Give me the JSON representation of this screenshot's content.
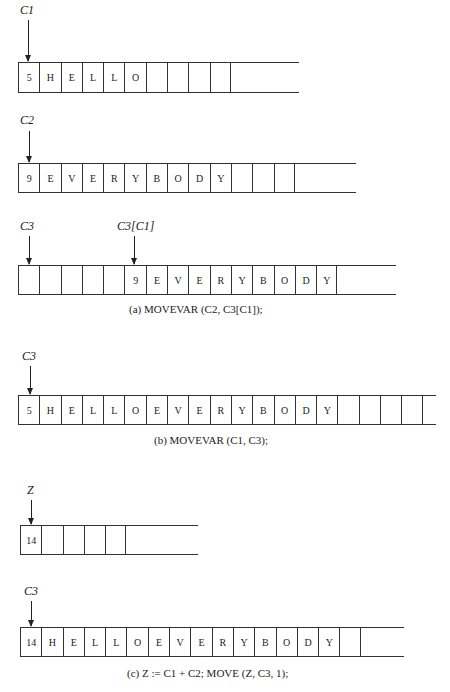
{
  "figure": {
    "panels": [
      {
        "id": "C1",
        "pointer_label": "C1",
        "cells": [
          "5",
          "H",
          "E",
          "L",
          "L",
          "O",
          "",
          "",
          "",
          ""
        ]
      },
      {
        "id": "C2",
        "pointer_label": "C2",
        "cells": [
          "9",
          "E",
          "V",
          "E",
          "R",
          "Y",
          "B",
          "O",
          "D",
          "Y",
          "",
          "",
          ""
        ]
      },
      {
        "id": "C3-a",
        "pointer_label": "C3",
        "secondary_pointer_label": "C3[C1]",
        "cells": [
          "",
          "",
          "",
          "",
          "",
          "9",
          "E",
          "V",
          "E",
          "R",
          "Y",
          "B",
          "O",
          "D",
          "Y"
        ]
      },
      {
        "id": "C3-b",
        "pointer_label": "C3",
        "cells": [
          "5",
          "H",
          "E",
          "L",
          "L",
          "O",
          "E",
          "V",
          "E",
          "R",
          "Y",
          "B",
          "O",
          "D",
          "Y",
          "",
          "",
          "",
          ""
        ]
      },
      {
        "id": "Z",
        "pointer_label": "Z",
        "cells": [
          "14",
          "",
          "",
          "",
          ""
        ]
      },
      {
        "id": "C3-c",
        "pointer_label": "C3",
        "cells": [
          "14",
          "H",
          "E",
          "L",
          "L",
          "O",
          "E",
          "V",
          "E",
          "R",
          "Y",
          "B",
          "O",
          "D",
          "Y",
          ""
        ]
      }
    ],
    "captions": {
      "a": "(a) MOVEVAR (C2, C3[C1]);",
      "b": "(b) MOVEVAR (C1, C3);",
      "c": "(c) Z := C1 + C2;  MOVE (Z, C3, 1);"
    }
  }
}
